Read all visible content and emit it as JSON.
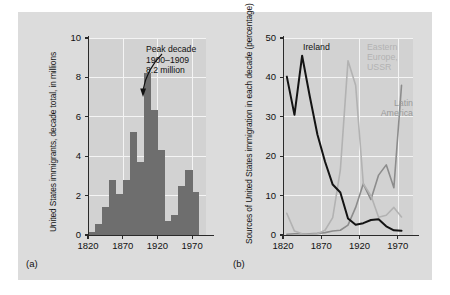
{
  "figure": {
    "background": "#dcdcdc",
    "panels": [
      {
        "caption": "(a)"
      },
      {
        "caption": "(b)"
      }
    ]
  },
  "chart_data": [
    {
      "type": "bar",
      "panel": "(a)",
      "title": "",
      "xlabel": "",
      "ylabel": "United States immigrants, decade total, in millions",
      "xlim": [
        1820,
        1990
      ],
      "ylim": [
        0,
        10
      ],
      "xticks": [
        1820,
        1870,
        1920,
        1970
      ],
      "xtick_labels": [
        "1820",
        "1870",
        "1920",
        "1970"
      ],
      "yticks": [
        0,
        2,
        4,
        6,
        8,
        10
      ],
      "ytick_labels": [
        "0",
        "2",
        "4",
        "6",
        "8",
        "10"
      ],
      "grid": true,
      "bar_color": "#6e6e6e",
      "categories": [
        "1820-1829",
        "1830-1839",
        "1840-1849",
        "1850-1859",
        "1860-1869",
        "1870-1879",
        "1880-1889",
        "1890-1899",
        "1900-1909",
        "1910-1919",
        "1920-1929",
        "1930-1939",
        "1940-1949",
        "1950-1959",
        "1960-1969",
        "1970-1979"
      ],
      "values": [
        0.13,
        0.54,
        1.43,
        2.81,
        2.08,
        2.81,
        5.25,
        3.69,
        8.2,
        6.35,
        4.3,
        0.7,
        1.04,
        2.5,
        3.32,
        2.2
      ],
      "annotations": [
        {
          "text": "Peak decade\n1900–1909\n8.2 million",
          "lines": [
            "Peak decade",
            "1900–1909",
            "8.2 million"
          ],
          "points_to_category": "1900-1909",
          "points_to_value": 8.2
        }
      ]
    },
    {
      "type": "line",
      "panel": "(b)",
      "title": "",
      "xlabel": "",
      "ylabel": "Sources of United States immigration in each decade (percentage)",
      "xlim": [
        1820,
        1990
      ],
      "ylim": [
        0,
        50
      ],
      "xticks": [
        1820,
        1870,
        1920,
        1970
      ],
      "xtick_labels": [
        "1820",
        "1870",
        "1920",
        "1970"
      ],
      "yticks": [
        0,
        10,
        20,
        30,
        40,
        50
      ],
      "ytick_labels": [
        "0",
        "10",
        "20",
        "30",
        "40",
        "50"
      ],
      "grid": true,
      "legend_position": "inline-labels",
      "x": [
        1825,
        1835,
        1845,
        1855,
        1865,
        1875,
        1885,
        1895,
        1905,
        1915,
        1925,
        1935,
        1945,
        1955,
        1965,
        1975
      ],
      "series": [
        {
          "name": "Ireland",
          "color": "#131313",
          "values": [
            40.2,
            30.5,
            45.5,
            35.2,
            25.5,
            18.6,
            12.8,
            10.8,
            4.2,
            2.6,
            3.0,
            3.8,
            4.0,
            2.2,
            1.2,
            1.1
          ]
        },
        {
          "name": "Eastern Europe, USSR",
          "color": "#b2b2b2",
          "values": [
            5.5,
            1.0,
            0.3,
            0.2,
            0.3,
            1.2,
            4.4,
            16.5,
            44.2,
            38.0,
            13.0,
            10.0,
            4.5,
            5.0,
            7.0,
            4.6
          ]
        },
        {
          "name": "Latin America",
          "color": "#8c8c8c",
          "values": [
            0.2,
            0.3,
            0.3,
            0.3,
            0.4,
            0.6,
            1.0,
            1.2,
            2.5,
            7.0,
            13.0,
            9.0,
            15.2,
            17.8,
            12.0,
            38.0
          ]
        }
      ]
    }
  ]
}
